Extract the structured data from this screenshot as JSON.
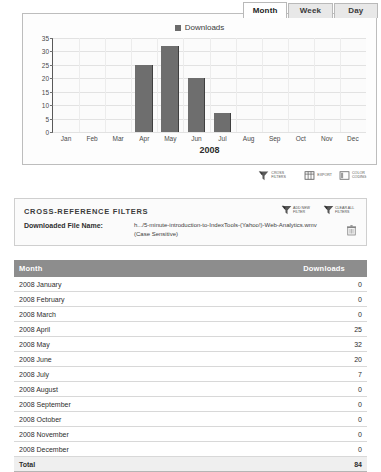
{
  "tabs": [
    {
      "label": "Month",
      "active": true
    },
    {
      "label": "Week",
      "active": false
    },
    {
      "label": "Day",
      "active": false
    }
  ],
  "chart_panel": {
    "legend_label": "Downloads",
    "legend_color": "#6e6e6e"
  },
  "chart_toolbar": [
    {
      "icon": "funnel-icon",
      "label": "CROSS FILTERS"
    },
    {
      "icon": "export-icon",
      "label": "EXPORT"
    },
    {
      "icon": "color-coding-icon",
      "label": "COLOR CODING"
    }
  ],
  "xref": {
    "title": "CROSS-REFERENCE FILTERS",
    "actions": [
      {
        "icon": "add-filter-icon",
        "label": "ADD NEW FILTER"
      },
      {
        "icon": "clear-filters-icon",
        "label": "CLEAR ALL FILTERS"
      }
    ],
    "filter_label": "Downloaded File Name:",
    "filter_value": "h.../5-minute-introduction-to-IndexTools-(Yahoo!)-Web-Analytics.wmv",
    "filter_case": "(Case Sensitive)",
    "delete_icon": "trash-icon"
  },
  "table": {
    "headers": [
      "Month",
      "Downloads"
    ],
    "rows": [
      {
        "month": "2008 January",
        "downloads": "0"
      },
      {
        "month": "2008 February",
        "downloads": "0"
      },
      {
        "month": "2008 March",
        "downloads": "0"
      },
      {
        "month": "2008 April",
        "downloads": "25"
      },
      {
        "month": "2008 May",
        "downloads": "32"
      },
      {
        "month": "2008 June",
        "downloads": "20"
      },
      {
        "month": "2008 July",
        "downloads": "7"
      },
      {
        "month": "2008 August",
        "downloads": "0"
      },
      {
        "month": "2008 September",
        "downloads": "0"
      },
      {
        "month": "2008 October",
        "downloads": "0"
      },
      {
        "month": "2008 November",
        "downloads": "0"
      },
      {
        "month": "2008 December",
        "downloads": "0"
      }
    ],
    "total_label": "Total",
    "total_value": "84"
  },
  "chart_data": {
    "type": "bar",
    "title": "",
    "legend": [
      "Downloads"
    ],
    "legend_position": "top-center",
    "categories": [
      "Jan",
      "Feb",
      "Mar",
      "Apr",
      "May",
      "Jun",
      "Jul",
      "Aug",
      "Sep",
      "Oct",
      "Nov",
      "Dec"
    ],
    "values": [
      0,
      0,
      0,
      25,
      32,
      20,
      7,
      0,
      0,
      0,
      0,
      0
    ],
    "xlabel": "2008",
    "ylabel": "",
    "ylim": [
      0,
      35
    ],
    "yticks": [
      0,
      5,
      10,
      15,
      20,
      25,
      30,
      35
    ],
    "grid": true,
    "bar_color": "#6e6e6e"
  }
}
